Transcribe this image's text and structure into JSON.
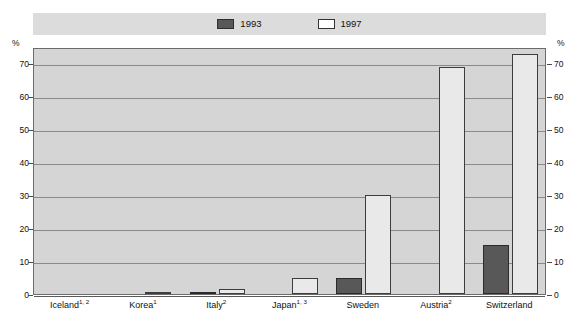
{
  "axis": {
    "unit_symbol_left": "%",
    "unit_symbol_right": "%",
    "ticks": [
      "0",
      "10",
      "20",
      "30",
      "40",
      "50",
      "60",
      "70"
    ]
  },
  "legend": {
    "items": [
      {
        "label": "1993",
        "swatch": "dark-filled-swatch",
        "color": "#585858"
      },
      {
        "label": "1997",
        "swatch": "light-outlined-swatch",
        "color": "#ffffff"
      }
    ]
  },
  "categories": [
    {
      "name": "Iceland",
      "sup": "1, 2"
    },
    {
      "name": "Korea",
      "sup": "1"
    },
    {
      "name": "Italy",
      "sup": "2"
    },
    {
      "name": "Japan",
      "sup": "1, 3"
    },
    {
      "name": "Sweden",
      "sup": ""
    },
    {
      "name": "Austria",
      "sup": "2"
    },
    {
      "name": "Switzerland",
      "sup": ""
    }
  ],
  "chart_data": {
    "type": "bar",
    "title": "",
    "xlabel": "",
    "ylabel": "%",
    "ylim": [
      0,
      75
    ],
    "yticks": [
      0,
      10,
      20,
      30,
      40,
      50,
      60,
      70
    ],
    "grid": true,
    "legend_position": "top-center",
    "categories": [
      "Iceland1, 2",
      "Korea1",
      "Italy2",
      "Japan1, 3",
      "Sweden",
      "Austria2",
      "Switzerland"
    ],
    "series": [
      {
        "name": "1993",
        "color": "#585858",
        "values": [
          0,
          0,
          0.3,
          0,
          5,
          0,
          15
        ]
      },
      {
        "name": "1997",
        "color": "#ffffff",
        "values": [
          0,
          0.5,
          1.5,
          5,
          30,
          69,
          73
        ]
      }
    ]
  }
}
